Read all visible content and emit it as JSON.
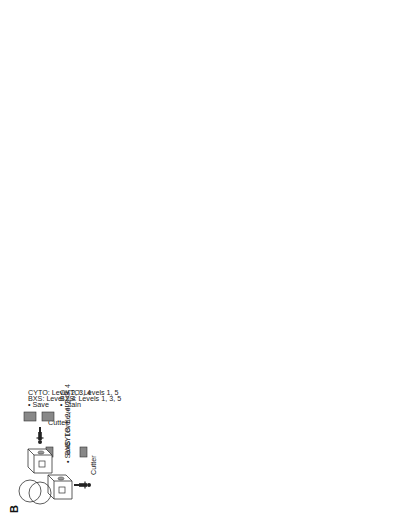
{
  "figure": {
    "panel_label": "B"
  },
  "process_boxes": {
    "dryer": {
      "line1": "Dryer",
      "line2": "17 mins"
    },
    "stainer": {
      "line1": "Stainer",
      "line2": "50 mins"
    },
    "coverslipper": {
      "line1": "Cover-",
      "line2": "slipper",
      "line3": "4 mins"
    },
    "bin": "BIN",
    "puh": "PUH",
    "ord": "ORD"
  },
  "cutter_stations": [
    {
      "person": "Cutter",
      "tasks": [
        "• Save",
        "BXS:   Level 2,4",
        "CYTO: Level 2, 3, 4"
      ]
    },
    {
      "person": "Cutter",
      "tasks": [
        "• Stain",
        "BXS:   Levels 1, 3, 5",
        "CYTO: Levels 1, 5"
      ]
    },
    {
      "person": "Cutter",
      "tasks": [
        "• Save",
        "• Stain"
      ]
    },
    {
      "person": "Specials histotech",
      "tasks": [
        "• Immunos",
        "2PM cutoff",
        "• Specials",
        "10AM cutoff",
        "• Recuts",
        "12N cutoff"
      ]
    }
  ],
  "notes": {
    "computer_logs": [
      "• Computer logs",
      "6AM, 9AM, 10AM,",
      "11AM, 12N, 1PM, 2PM"
    ],
    "immunos_presby": [
      "• Immunos",
      "to PRESBY"
    ],
    "courier": "Courier",
    "pa_stainer": [
      "PA",
      "• Review",
      "working draft",
      "• Correct"
    ],
    "pa_mid": [
      "PA",
      "• Review",
      "working draft",
      "• Correct"
    ],
    "pa_right": [
      "PA",
      "• Review",
      "working draft",
      "• Correct"
    ],
    "paper_label": [
      "• Paper",
      "label",
      "• Distribute"
    ],
    "resident": "Resident",
    "transcriptionist": [
      "Transcriptionist",
      "Working draft"
    ],
    "additional_requests": "Additional requests",
    "gu_path": [
      "GU",
      "path"
    ],
    "derm_path": [
      "Derm",
      "path"
    ],
    "path": "Path"
  },
  "facing_blocks": {
    "title1": "*FACING BLOCKS",
    "title2": "CYCLE TIMES",
    "col1": [
      ":08",
      ":09",
      ":06",
      ":11",
      ":06"
    ],
    "col2": [
      ":11",
      ":11",
      ":08",
      ":07",
      ":07"
    ]
  },
  "cutting_cycle_times": {
    "title": "*CUTTING CYCLE TIMES",
    "headers": [
      "Breast",
      "OP Skins",
      "GU",
      "BIGS",
      "BXS",
      "CYTO"
    ],
    "columns": {
      "breast": [
        "1:08",
        ":51",
        "1:09",
        ":52",
        ":38",
        ":36",
        ":52",
        ":41",
        "1:34",
        ":55"
      ],
      "op_skins": [
        ":57",
        ":50",
        "1:09",
        "1:22",
        "1:36",
        "1:40",
        "1:57",
        "1:26",
        "1:25",
        "2:15",
        "2:03"
      ],
      "gu": [
        ":46",
        "1:07",
        "1:17",
        ":40",
        ":53",
        ":55",
        ":54",
        ":37",
        ":36",
        ":39"
      ],
      "bigs": [
        ":56",
        ":43",
        ":35",
        ":34",
        ":42",
        ":51",
        ":55",
        ":40",
        ":30",
        ":38"
      ],
      "bxs": [
        "3:07",
        "2:32",
        "3:14",
        "2:27",
        "2:53",
        "2:48",
        "3:31",
        "3:19",
        "2:24",
        "1:31"
      ],
      "cyto": [
        "5:53",
        "5:17",
        "5:44",
        "6:14",
        "5:01",
        "3:53",
        "3:29"
      ]
    }
  },
  "colors": {
    "line": "#333333",
    "text": "#222222",
    "background": "#ffffff"
  }
}
